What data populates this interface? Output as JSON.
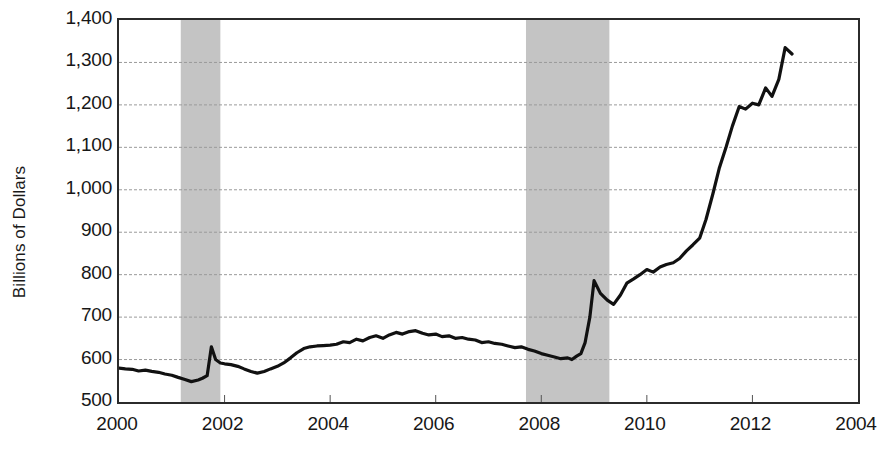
{
  "chart_data": {
    "type": "line",
    "title": "",
    "xlabel": "",
    "ylabel": "Billions of Dollars",
    "grid": true,
    "legend": "none",
    "xlim": [
      2000,
      2014
    ],
    "ylim": [
      500,
      1400
    ],
    "y_ticks": [
      500,
      600,
      700,
      800,
      900,
      1000,
      1100,
      1200,
      1300,
      1400
    ],
    "y_tick_labels": [
      "500",
      "600",
      "700",
      "800",
      "900",
      "1,000",
      "1,100",
      "1,200",
      "1,300",
      "1,400"
    ],
    "x_ticks": [
      2000,
      2002,
      2004,
      2006,
      2008,
      2010,
      2012,
      2014
    ],
    "x_tick_labels": [
      "2000",
      "2002",
      "2004",
      "2006",
      "2008",
      "2010",
      "2012",
      "2004"
    ],
    "shaded_regions": [
      {
        "name": "recession-2001",
        "x_start": 2001.17,
        "x_end": 2001.92,
        "color": "#c4c4c4"
      },
      {
        "name": "recession-2008",
        "x_start": 2007.71,
        "x_end": 2009.29,
        "color": "#c4c4c4"
      }
    ],
    "series": [
      {
        "name": "Currency in circulation",
        "color": "#111111",
        "x": [
          2000.0,
          2000.12,
          2000.25,
          2000.37,
          2000.5,
          2000.62,
          2000.75,
          2000.87,
          2001.0,
          2001.12,
          2001.25,
          2001.37,
          2001.5,
          2001.58,
          2001.67,
          2001.75,
          2001.83,
          2001.92,
          2002.0,
          2002.12,
          2002.25,
          2002.37,
          2002.5,
          2002.62,
          2002.75,
          2002.87,
          2003.0,
          2003.12,
          2003.25,
          2003.37,
          2003.5,
          2003.62,
          2003.75,
          2003.87,
          2004.0,
          2004.12,
          2004.25,
          2004.37,
          2004.5,
          2004.62,
          2004.75,
          2004.87,
          2005.0,
          2005.12,
          2005.25,
          2005.37,
          2005.5,
          2005.62,
          2005.75,
          2005.87,
          2006.0,
          2006.12,
          2006.25,
          2006.37,
          2006.5,
          2006.62,
          2006.75,
          2006.87,
          2007.0,
          2007.12,
          2007.25,
          2007.37,
          2007.5,
          2007.62,
          2007.75,
          2007.87,
          2008.0,
          2008.12,
          2008.25,
          2008.37,
          2008.5,
          2008.58,
          2008.67,
          2008.75,
          2008.83,
          2008.92,
          2009.0,
          2009.12,
          2009.25,
          2009.37,
          2009.5,
          2009.62,
          2009.75,
          2009.87,
          2010.0,
          2010.12,
          2010.25,
          2010.37,
          2010.5,
          2010.62,
          2010.75,
          2010.87,
          2011.0,
          2011.12,
          2011.25,
          2011.37,
          2011.5,
          2011.62,
          2011.75,
          2011.87,
          2012.0,
          2012.12,
          2012.25,
          2012.37,
          2012.5,
          2012.62,
          2012.75
        ],
        "y": [
          580,
          578,
          577,
          573,
          575,
          572,
          570,
          566,
          563,
          558,
          553,
          548,
          552,
          556,
          562,
          630,
          600,
          592,
          590,
          588,
          584,
          578,
          572,
          568,
          572,
          578,
          584,
          592,
          604,
          616,
          626,
          630,
          632,
          633,
          634,
          636,
          642,
          640,
          648,
          644,
          652,
          656,
          650,
          658,
          664,
          660,
          666,
          668,
          662,
          658,
          660,
          654,
          656,
          650,
          652,
          648,
          646,
          640,
          642,
          638,
          636,
          632,
          628,
          630,
          624,
          620,
          614,
          610,
          606,
          602,
          604,
          600,
          608,
          614,
          640,
          700,
          786,
          756,
          740,
          730,
          752,
          780,
          790,
          800,
          812,
          806,
          818,
          824,
          828,
          838,
          856,
          870,
          886,
          930,
          990,
          1050,
          1100,
          1150,
          1196,
          1190,
          1204,
          1200,
          1240,
          1220,
          1260,
          1335,
          1320
        ]
      }
    ]
  }
}
